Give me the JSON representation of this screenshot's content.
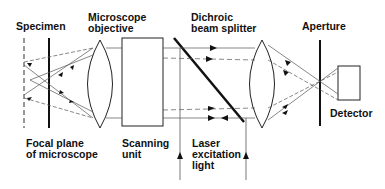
{
  "labels": {
    "specimen": "Specimen",
    "objective": "Microscope\nobjective",
    "beam_splitter": "Dichroic\nbeam splitter",
    "aperture": "Aperture",
    "focal_plane": "Focal plane\nof microscope",
    "scanning_unit": "Scanning\nunit",
    "laser": "Laser\nexcitation\nlight",
    "detector": "Detector"
  },
  "colors": {
    "line": "#111111",
    "thin_line": "#555555",
    "background": "#ffffff"
  }
}
